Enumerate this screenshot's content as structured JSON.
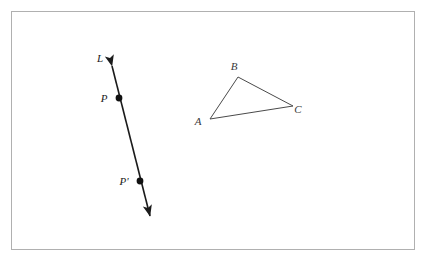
{
  "figure": {
    "background_color": "#ffffff",
    "frame": {
      "name": "figure-border",
      "x": 11,
      "y": 11,
      "width": 404,
      "height": 239,
      "stroke_color": "#b0b0b0",
      "stroke_width": 1
    },
    "line_figure": {
      "name": "line-L",
      "stroke_color": "#1b1b1b",
      "stroke_width": 1.6,
      "start": {
        "x": 112,
        "y": 66
      },
      "end": {
        "x": 150,
        "y": 216
      },
      "arrow_start": true,
      "arrow_end": true,
      "labels": [
        {
          "text": "L",
          "x": 100,
          "y": 62
        },
        {
          "text": "P",
          "x": 104,
          "y": 102
        },
        {
          "text": "P'",
          "x": 124,
          "y": 185
        }
      ],
      "points": [
        {
          "name": "point-P",
          "label": "P",
          "x": 119,
          "y": 98,
          "radius": 3.4
        },
        {
          "name": "point-P-prime",
          "label": "P'",
          "x": 140,
          "y": 181,
          "radius": 3.4
        }
      ]
    },
    "triangle_figure": {
      "name": "triangle-ABC",
      "stroke_color": "#4a4a4a",
      "stroke_width": 1,
      "vertices": [
        {
          "label": "A",
          "x": 210,
          "y": 119
        },
        {
          "label": "B",
          "x": 238,
          "y": 77
        },
        {
          "label": "C",
          "x": 293,
          "y": 106
        }
      ],
      "labels": [
        {
          "text": "A",
          "x": 198,
          "y": 125
        },
        {
          "text": "B",
          "x": 234,
          "y": 70
        },
        {
          "text": "C",
          "x": 298,
          "y": 113
        }
      ]
    }
  }
}
